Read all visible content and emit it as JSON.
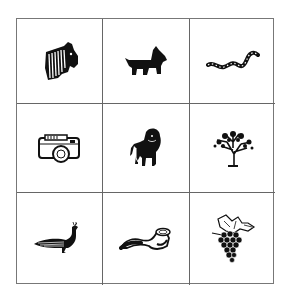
{
  "grid": {
    "rows": 3,
    "cols": 3,
    "cells": [
      {
        "label": "zebra",
        "icon": "zebra-icon"
      },
      {
        "label": "scottish terrier dog",
        "icon": "dog-icon"
      },
      {
        "label": "snake",
        "icon": "snake-icon"
      },
      {
        "label": "camera",
        "icon": "camera-icon"
      },
      {
        "label": "lion",
        "icon": "lion-icon"
      },
      {
        "label": "tree",
        "icon": "tree-icon"
      },
      {
        "label": "peacock",
        "icon": "peacock-icon"
      },
      {
        "label": "smoking pipe",
        "icon": "pipe-icon"
      },
      {
        "label": "grapes",
        "icon": "grapes-icon"
      }
    ]
  },
  "colors": {
    "line": "#666666",
    "ink": "#111111",
    "background": "#ffffff"
  }
}
